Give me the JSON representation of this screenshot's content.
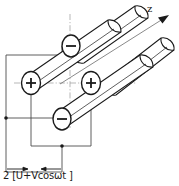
{
  "figure": {
    "title_caption": "2 [U+Vcosωt ]",
    "axis": {
      "label": "z",
      "icon": "arrow-up-right-icon"
    },
    "electrodes": [
      {
        "id": "top",
        "polarity": "−",
        "name": "electrode-top-negative"
      },
      {
        "id": "left-middle",
        "polarity": "+",
        "name": "electrode-left-positive"
      },
      {
        "id": "right-middle",
        "polarity": "+",
        "name": "electrode-right-positive"
      },
      {
        "id": "bottom",
        "polarity": "−",
        "name": "electrode-bottom-negative"
      }
    ],
    "colors": {
      "stroke": "#1a1a1a",
      "wire": "#555555",
      "centerline": "#888888",
      "background": "#ffffff"
    }
  }
}
